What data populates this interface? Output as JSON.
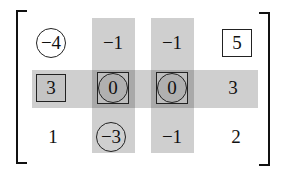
{
  "diagram": {
    "type": "matrix",
    "rows": 3,
    "cols": 4,
    "highlighted_rows": [
      2
    ],
    "highlighted_cols": [
      2,
      3
    ],
    "colors": {
      "band": "#cfcfcf",
      "intersection": "#a9a9a9",
      "ink": "#111111",
      "background": "#ffffff"
    },
    "cells": [
      [
        {
          "value": "−4",
          "mark": "circle"
        },
        {
          "value": "−1",
          "mark": "none"
        },
        {
          "value": "−1",
          "mark": "none"
        },
        {
          "value": "5",
          "mark": "box"
        }
      ],
      [
        {
          "value": "3",
          "mark": "box"
        },
        {
          "value": "0",
          "mark": "circle-box"
        },
        {
          "value": "0",
          "mark": "circle-box"
        },
        {
          "value": "3",
          "mark": "none"
        }
      ],
      [
        {
          "value": "1",
          "mark": "none"
        },
        {
          "value": "−3",
          "mark": "circle"
        },
        {
          "value": "−1",
          "mark": "none"
        },
        {
          "value": "2",
          "mark": "none"
        }
      ]
    ]
  }
}
